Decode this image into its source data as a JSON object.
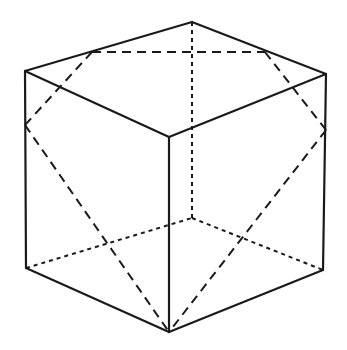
{
  "figure": {
    "title": "",
    "stroke_color": "#1a1a1a",
    "background": "#ffffff"
  },
  "vertices": {
    "top_back": [
      192,
      22
    ],
    "top_left": [
      25,
      71
    ],
    "top_right": [
      326,
      74
    ],
    "top_front": [
      169,
      137
    ],
    "bottom_left": [
      26,
      268
    ],
    "bottom_right": [
      323,
      270
    ],
    "bottom_front": [
      169,
      332
    ],
    "bottom_back_hidden": [
      192,
      218
    ]
  },
  "cross_section_points": {
    "top_left_edge_point": [
      92,
      52
    ],
    "top_right_edge_point": [
      265,
      52
    ],
    "left_edge_point": [
      25,
      125
    ],
    "right_edge_point": [
      326,
      130
    ],
    "bottom_front_point": [
      169,
      332
    ]
  }
}
